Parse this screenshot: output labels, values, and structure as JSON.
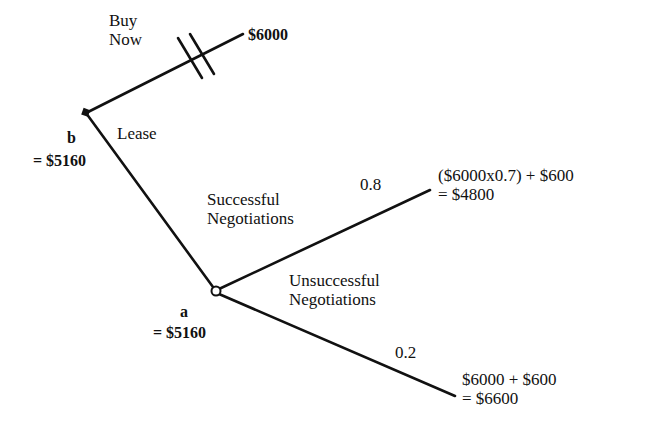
{
  "diagram": {
    "type": "decision-tree",
    "colors": {
      "line": "#111111",
      "background": "#ffffff"
    },
    "nodes": {
      "b": {
        "name": "b",
        "value": "= $5160",
        "kind": "decision"
      },
      "a": {
        "name": "a",
        "value": "= $5160",
        "kind": "chance"
      }
    },
    "branches": {
      "buy_now": {
        "label_line1": "Buy",
        "label_line2": "Now",
        "outcome": "$6000",
        "pruned": true
      },
      "lease": {
        "label": "Lease"
      },
      "successful": {
        "label_line1": "Successful",
        "label_line2": "Negotiations",
        "probability": "0.8",
        "outcome_line1": "($6000x0.7) + $600",
        "outcome_line2": "= $4800"
      },
      "unsuccessful": {
        "label_line1": "Unsuccessful",
        "label_line2": "Negotiations",
        "probability": "0.2",
        "outcome_line1": "$6000 + $600",
        "outcome_line2": "= $6600"
      }
    }
  }
}
